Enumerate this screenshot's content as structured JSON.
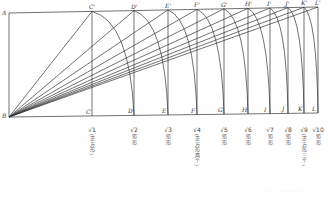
{
  "diagram": {
    "points": {
      "A": "A",
      "B": "B",
      "top": [
        "C'",
        "D'",
        "E'",
        "F'",
        "G'",
        "H'",
        "I'",
        "J'",
        "K'",
        "L'"
      ],
      "bottom": [
        "C",
        "D",
        "E",
        "F",
        "G",
        "H",
        "I",
        "J",
        "K",
        "L"
      ]
    },
    "x_positions": [
      92,
      134,
      168,
      197,
      224,
      248,
      270,
      288,
      304,
      318
    ],
    "captions": [
      {
        "root": "√1",
        "desc": "(正方形)"
      },
      {
        "root": "√2",
        "desc": "矩形"
      },
      {
        "root": "√3",
        "desc": "矩形"
      },
      {
        "root": "√4",
        "desc": "(正方形两个)"
      },
      {
        "root": "√5",
        "desc": "矩形"
      },
      {
        "root": "√6",
        "desc": "矩形"
      },
      {
        "root": "√7",
        "desc": "矩形"
      },
      {
        "root": "√8",
        "desc": "矩形"
      },
      {
        "root": "√9",
        "desc": "(正方形三个)"
      },
      {
        "root": "√10",
        "desc": "矩形"
      }
    ],
    "footnote": "· · · · · · · · · · · ·"
  }
}
